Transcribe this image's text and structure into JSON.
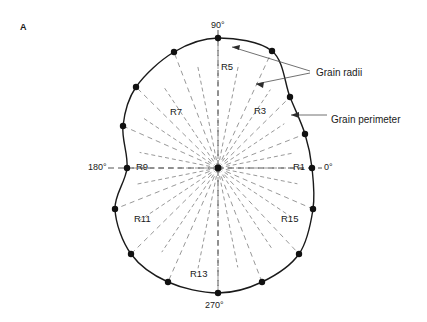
{
  "figure": {
    "panel_label": "A",
    "background_color": "#ffffff",
    "perimeter_color": "#1a1a1a",
    "radii_color": "#8c8c8c",
    "vertex_color": "#111111",
    "annotation_color": "#4d4d4d"
  },
  "annotations": [
    {
      "id": "grain-radii",
      "text": "Grain radii",
      "x": 316,
      "y": 68
    },
    {
      "id": "grain-perimeter",
      "text": "Grain perimeter",
      "x": 331,
      "y": 115
    }
  ],
  "angle_labels": [
    {
      "id": "deg-90",
      "text": "90°",
      "x": 211,
      "y": 21
    },
    {
      "id": "deg-0",
      "text": "0°",
      "x": 324,
      "y": 163
    },
    {
      "id": "deg-180",
      "text": "180°",
      "x": 88,
      "y": 163
    },
    {
      "id": "deg-270",
      "text": "270°",
      "x": 205,
      "y": 301
    }
  ],
  "radius_labels": [
    {
      "id": "R1",
      "text": "R1",
      "x": 293,
      "y": 162
    },
    {
      "id": "R3",
      "text": "R3",
      "x": 254,
      "y": 106
    },
    {
      "id": "R5",
      "text": "R5",
      "x": 221,
      "y": 62
    },
    {
      "id": "R7",
      "text": "R7",
      "x": 170,
      "y": 107
    },
    {
      "id": "R9",
      "text": "R9",
      "x": 136,
      "y": 162
    },
    {
      "id": "R11",
      "text": "R11",
      "x": 134,
      "y": 214
    },
    {
      "id": "R13",
      "text": "R13",
      "x": 190,
      "y": 269
    },
    {
      "id": "R15",
      "text": "R15",
      "x": 281,
      "y": 214
    }
  ],
  "chart_data": {
    "type": "polar-outline",
    "center": {
      "x": 218,
      "y": 168
    },
    "angle_step_degrees": 22.5,
    "radii_count": 16,
    "sub_spoke_step_degrees": 11.25,
    "vertices": [
      {
        "label": "R1",
        "angle": 0,
        "x": 312,
        "y": 168
      },
      {
        "label": "R2",
        "angle": 22.5,
        "x": 305,
        "y": 134
      },
      {
        "label": "R3",
        "angle": 45,
        "x": 290,
        "y": 97
      },
      {
        "label": "R4",
        "angle": 67.5,
        "x": 272,
        "y": 51
      },
      {
        "label": "R5",
        "angle": 90,
        "x": 218,
        "y": 38
      },
      {
        "label": "R6",
        "angle": 112.5,
        "x": 174,
        "y": 52
      },
      {
        "label": "R7",
        "angle": 135,
        "x": 136,
        "y": 87
      },
      {
        "label": "R8",
        "angle": 157.5,
        "x": 123,
        "y": 126
      },
      {
        "label": "R9",
        "angle": 180,
        "x": 127,
        "y": 168
      },
      {
        "label": "R10",
        "angle": 202.5,
        "x": 115,
        "y": 209
      },
      {
        "label": "R11",
        "angle": 225,
        "x": 131,
        "y": 254
      },
      {
        "label": "R12",
        "angle": 247.5,
        "x": 168,
        "y": 282
      },
      {
        "label": "R13",
        "angle": 270,
        "x": 218,
        "y": 293
      },
      {
        "label": "R14",
        "angle": 292.5,
        "x": 262,
        "y": 282
      },
      {
        "label": "R15",
        "angle": 315,
        "x": 299,
        "y": 254
      },
      {
        "label": "R16",
        "angle": 337.5,
        "x": 313,
        "y": 209
      }
    ],
    "axis_lines": [
      "0°-180°",
      "90°-270°"
    ],
    "grid": false,
    "legend": "none"
  }
}
